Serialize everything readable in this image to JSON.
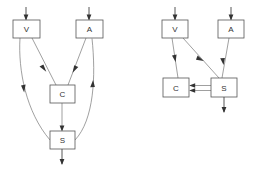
{
  "figure": {
    "background_color": "#ffffff",
    "box_stroke_color": "#555555",
    "box_fill_color": "#ffffff",
    "edge_color": "#777777",
    "label_color": "#333333",
    "arrow_color": "#333333"
  },
  "diagrams": [
    {
      "id": "left",
      "name": "left-diagram",
      "nodes": [
        {
          "id": "V",
          "label": "V",
          "x": 13,
          "y": 20,
          "w": 27,
          "h": 18
        },
        {
          "id": "A",
          "label": "A",
          "x": 76,
          "y": 20,
          "w": 27,
          "h": 18
        },
        {
          "id": "C",
          "label": "C",
          "x": 50,
          "y": 85,
          "w": 25,
          "h": 18
        },
        {
          "id": "S",
          "label": "S",
          "x": 50,
          "y": 131,
          "w": 25,
          "h": 18
        }
      ],
      "io_arrows": [
        {
          "id": "in-V",
          "label": "input-arrow-v",
          "kind": "input",
          "x": 26,
          "y_from": 7,
          "y_to": 20
        },
        {
          "id": "in-A",
          "label": "input-arrow-a",
          "kind": "input",
          "x": 89,
          "y_from": 7,
          "y_to": 20
        },
        {
          "id": "out-S",
          "label": "output-arrow-s",
          "kind": "output",
          "x": 62,
          "y_from": 149,
          "y_to": 164
        }
      ],
      "edges": [
        {
          "id": "V-C",
          "from": "V",
          "to": "C",
          "label": "edge-v-to-c",
          "style": "straight"
        },
        {
          "id": "A-C",
          "from": "A",
          "to": "C",
          "label": "edge-a-to-c",
          "style": "straight"
        },
        {
          "id": "C-S",
          "from": "C",
          "to": "S",
          "label": "edge-c-to-s",
          "style": "straight"
        },
        {
          "id": "V-S",
          "from": "V",
          "to": "S",
          "label": "edge-v-to-s",
          "style": "curved-left"
        },
        {
          "id": "S-A",
          "from": "S",
          "to": "A",
          "label": "edge-s-to-a",
          "style": "curved-right"
        }
      ]
    },
    {
      "id": "right",
      "name": "right-diagram",
      "nodes": [
        {
          "id": "V",
          "label": "V",
          "x": 162,
          "y": 20,
          "w": 26,
          "h": 18
        },
        {
          "id": "A",
          "label": "A",
          "x": 218,
          "y": 20,
          "w": 26,
          "h": 18
        },
        {
          "id": "C",
          "label": "C",
          "x": 163,
          "y": 78,
          "w": 26,
          "h": 19
        },
        {
          "id": "S",
          "label": "S",
          "x": 211,
          "y": 78,
          "w": 26,
          "h": 19
        }
      ],
      "io_arrows": [
        {
          "id": "in-V",
          "label": "input-arrow-v",
          "kind": "input",
          "x": 175,
          "y_from": 7,
          "y_to": 20
        },
        {
          "id": "in-A",
          "label": "input-arrow-a",
          "kind": "input",
          "x": 231,
          "y_from": 7,
          "y_to": 20
        },
        {
          "id": "out-S",
          "label": "output-arrow-s",
          "kind": "output",
          "x": 224,
          "y_from": 97,
          "y_to": 112
        }
      ],
      "edges": [
        {
          "id": "V-C",
          "from": "V",
          "to": "C",
          "label": "edge-v-to-c",
          "style": "straight"
        },
        {
          "id": "V-S",
          "from": "V",
          "to": "S",
          "label": "edge-v-to-s",
          "style": "straight"
        },
        {
          "id": "A-S",
          "from": "A",
          "to": "S",
          "label": "edge-a-to-s",
          "style": "straight"
        },
        {
          "id": "S-C-upper",
          "from": "S",
          "to": "C",
          "label": "edge-s-to-c-upper",
          "style": "horizontal"
        },
        {
          "id": "S-C-lower",
          "from": "S",
          "to": "C",
          "label": "edge-s-to-c-lower",
          "style": "horizontal"
        }
      ]
    }
  ],
  "labels": {
    "left": {
      "V": "V",
      "A": "A",
      "C": "C",
      "S": "S"
    },
    "right": {
      "V": "V",
      "A": "A",
      "C": "C",
      "S": "S"
    }
  }
}
